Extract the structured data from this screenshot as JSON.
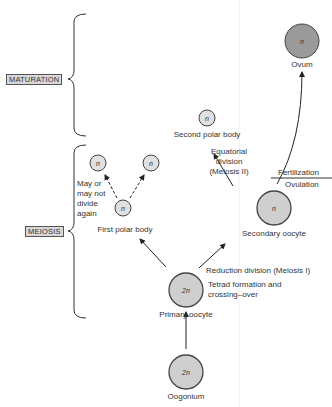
{
  "stages": {
    "maturation": "MATURATION",
    "meiosis": "MEIOSIS"
  },
  "cells": {
    "ovum": {
      "label": "Ovum",
      "ploidy": "n",
      "color": "#9a9a9a"
    },
    "second_polar_body": {
      "label": "Second polar body",
      "ploidy": "n",
      "color": "#e0e0e0"
    },
    "secondary_oocyte": {
      "label": "Secondary oocyte",
      "ploidy": "n",
      "color": "#cfcfcf"
    },
    "first_polar_body": {
      "label": "First polar body",
      "ploidy": "n",
      "color": "#e0e0e0"
    },
    "polar_daughter_left": {
      "ploidy": "n",
      "color": "#e0e0e0"
    },
    "polar_daughter_right": {
      "ploidy": "n",
      "color": "#e0e0e0"
    },
    "primary_oocyte": {
      "label": "Primary oocyte",
      "ploidy": "2n",
      "color": "#cfcfcf"
    },
    "oogonium": {
      "label": "Oogonium",
      "ploidy": "2n",
      "color": "#cfcfcf"
    }
  },
  "annotations": {
    "may_not_divide": [
      "May or",
      "may not",
      "divide",
      "again"
    ],
    "equatorial": [
      "Equatorial",
      "division",
      "(Meiosis II)"
    ],
    "fertilization": "Fertilization",
    "ovulation": "Ovulation",
    "reduction": "Reduction division (Meiosis I)",
    "tetrad": [
      "Tetrad formation and",
      "crossing–over"
    ]
  }
}
